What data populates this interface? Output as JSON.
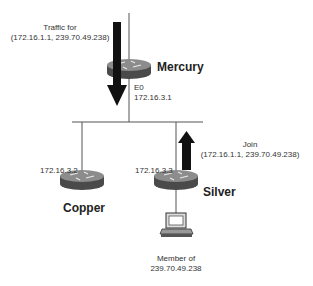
{
  "diagram": {
    "nodes": {
      "mercury": {
        "name": "Mercury",
        "interface": "E0",
        "ip": "172.16.3.1"
      },
      "copper": {
        "name": "Copper",
        "ip": "172.16.3.2"
      },
      "silver": {
        "name": "Silver",
        "ip": "172.16.3.3"
      },
      "host": {
        "label_line1": "Member of",
        "label_line2": "239.70.49.238"
      }
    },
    "annotations": {
      "traffic": {
        "line1": "Traffic for",
        "line2": "(172.16.1.1, 239.70.49.238)"
      },
      "join": {
        "line1": "Join",
        "line2": "(172.16.1.1, 239.70.49.238)"
      }
    },
    "colors": {
      "router_top": "#8a8a8a",
      "router_side": "#4a4a4a",
      "arrow": "#111111",
      "line": "#555555"
    }
  }
}
